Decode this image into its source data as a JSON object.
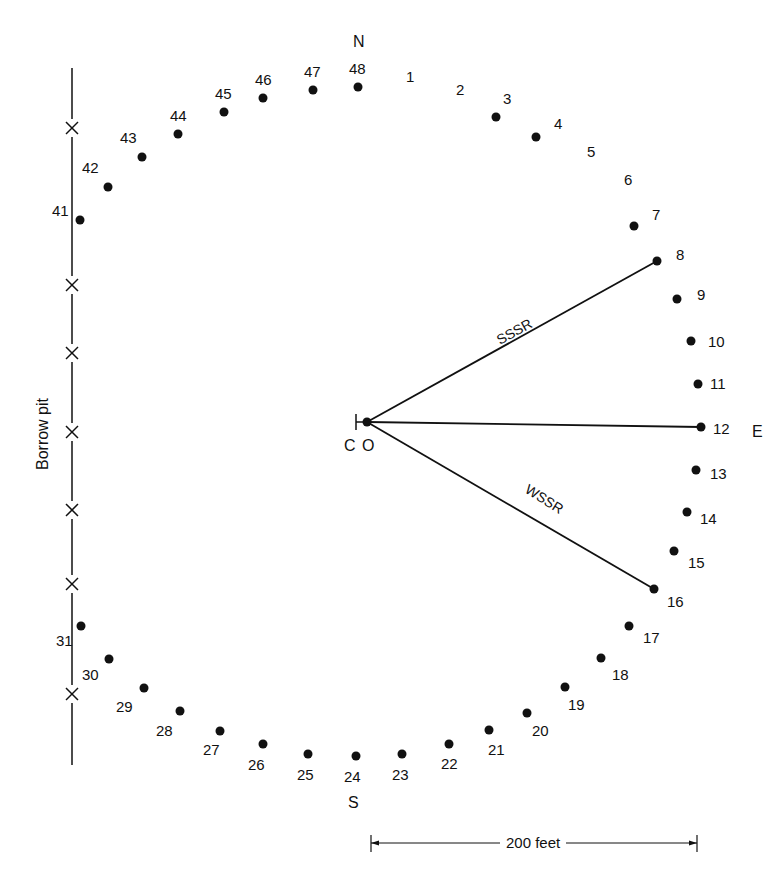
{
  "diagram": {
    "directions": {
      "north": "N",
      "east": "E",
      "south": "S"
    },
    "center": {
      "cross_label": "C",
      "point_label": "O",
      "x": 367,
      "y": 422
    },
    "borrow_pit": {
      "label": "Borrow pit",
      "x": 72,
      "y_top": 68,
      "y_bottom": 765,
      "x_marks_y": [
        128,
        285,
        353,
        432,
        510,
        584,
        694
      ]
    },
    "rays": [
      {
        "label": "SSSR",
        "to": 8
      },
      {
        "label": "",
        "to": 12
      },
      {
        "label": "WSSR",
        "to": 16
      }
    ],
    "scale_bar": {
      "label": "200 feet",
      "x1": 371,
      "x2": 697,
      "y": 843
    },
    "stations": [
      {
        "n": "1",
        "x": 0,
        "y": 0,
        "dot": false,
        "lx": 406,
        "ly": 82
      },
      {
        "n": "2",
        "x": 0,
        "y": 0,
        "dot": false,
        "lx": 456,
        "ly": 95
      },
      {
        "n": "3",
        "x": 496,
        "y": 117,
        "dot": true,
        "lx": 503,
        "ly": 104
      },
      {
        "n": "4",
        "x": 536,
        "y": 137,
        "dot": true,
        "lx": 554,
        "ly": 129
      },
      {
        "n": "5",
        "x": 0,
        "y": 0,
        "dot": false,
        "lx": 587,
        "ly": 157
      },
      {
        "n": "6",
        "x": 0,
        "y": 0,
        "dot": false,
        "lx": 624,
        "ly": 185
      },
      {
        "n": "7",
        "x": 634,
        "y": 226,
        "dot": true,
        "lx": 652,
        "ly": 220
      },
      {
        "n": "8",
        "x": 657,
        "y": 261,
        "dot": true,
        "lx": 676,
        "ly": 260
      },
      {
        "n": "9",
        "x": 677,
        "y": 299,
        "dot": true,
        "lx": 697,
        "ly": 300
      },
      {
        "n": "10",
        "x": 691,
        "y": 341,
        "dot": true,
        "lx": 708,
        "ly": 347
      },
      {
        "n": "11",
        "x": 698,
        "y": 384,
        "dot": true,
        "lx": 710,
        "ly": 389
      },
      {
        "n": "12",
        "x": 701,
        "y": 427,
        "dot": true,
        "lx": 713,
        "ly": 434
      },
      {
        "n": "13",
        "x": 696,
        "y": 470,
        "dot": true,
        "lx": 710,
        "ly": 479
      },
      {
        "n": "14",
        "x": 687,
        "y": 512,
        "dot": true,
        "lx": 700,
        "ly": 524
      },
      {
        "n": "15",
        "x": 674,
        "y": 551,
        "dot": true,
        "lx": 688,
        "ly": 568
      },
      {
        "n": "16",
        "x": 654,
        "y": 589,
        "dot": true,
        "lx": 667,
        "ly": 607
      },
      {
        "n": "17",
        "x": 629,
        "y": 626,
        "dot": true,
        "lx": 643,
        "ly": 643
      },
      {
        "n": "18",
        "x": 601,
        "y": 658,
        "dot": true,
        "lx": 612,
        "ly": 680
      },
      {
        "n": "19",
        "x": 565,
        "y": 687,
        "dot": true,
        "lx": 568,
        "ly": 710
      },
      {
        "n": "20",
        "x": 527,
        "y": 713,
        "dot": true,
        "lx": 532,
        "ly": 736
      },
      {
        "n": "21",
        "x": 489,
        "y": 730,
        "dot": true,
        "lx": 488,
        "ly": 755
      },
      {
        "n": "22",
        "x": 449,
        "y": 744,
        "dot": true,
        "lx": 441,
        "ly": 769
      },
      {
        "n": "23",
        "x": 402,
        "y": 754,
        "dot": true,
        "lx": 392,
        "ly": 780
      },
      {
        "n": "24",
        "x": 356,
        "y": 756,
        "dot": true,
        "lx": 344,
        "ly": 782
      },
      {
        "n": "25",
        "x": 308,
        "y": 754,
        "dot": true,
        "lx": 297,
        "ly": 780
      },
      {
        "n": "26",
        "x": 263,
        "y": 744,
        "dot": true,
        "lx": 248,
        "ly": 770
      },
      {
        "n": "27",
        "x": 220,
        "y": 731,
        "dot": true,
        "lx": 203,
        "ly": 755
      },
      {
        "n": "28",
        "x": 180,
        "y": 711,
        "dot": true,
        "lx": 156,
        "ly": 736
      },
      {
        "n": "29",
        "x": 144,
        "y": 688,
        "dot": true,
        "lx": 116,
        "ly": 712
      },
      {
        "n": "30",
        "x": 109,
        "y": 659,
        "dot": true,
        "lx": 82,
        "ly": 680
      },
      {
        "n": "31",
        "x": 81,
        "y": 626,
        "dot": true,
        "lx": 56,
        "ly": 646
      },
      {
        "n": "41",
        "x": 80,
        "y": 220,
        "dot": true,
        "lx": 52,
        "ly": 216
      },
      {
        "n": "42",
        "x": 108,
        "y": 187,
        "dot": true,
        "lx": 82,
        "ly": 173
      },
      {
        "n": "43",
        "x": 142,
        "y": 157,
        "dot": true,
        "lx": 120,
        "ly": 143
      },
      {
        "n": "44",
        "x": 178,
        "y": 134,
        "dot": true,
        "lx": 170,
        "ly": 121
      },
      {
        "n": "45",
        "x": 224,
        "y": 112,
        "dot": true,
        "lx": 215,
        "ly": 99
      },
      {
        "n": "46",
        "x": 263,
        "y": 98,
        "dot": true,
        "lx": 255,
        "ly": 85
      },
      {
        "n": "47",
        "x": 313,
        "y": 90,
        "dot": true,
        "lx": 304,
        "ly": 77
      },
      {
        "n": "48",
        "x": 358,
        "y": 87,
        "dot": true,
        "lx": 349,
        "ly": 74
      }
    ]
  }
}
